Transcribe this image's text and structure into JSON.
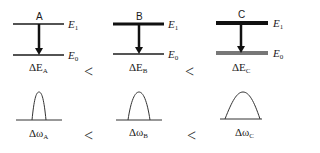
{
  "systems": [
    {
      "name": "A",
      "upper_level": "E",
      "upper_sub": "1",
      "lower_level": "E",
      "lower_sub": "0",
      "energy_delta": "ΔE",
      "energy_delta_sub": "A",
      "freq_delta": "Δω",
      "freq_delta_sub": "A",
      "upper_thickness": 1.5,
      "lower_thickness": 1.5,
      "lower_color": "#1a1a1a"
    },
    {
      "name": "B",
      "upper_level": "E",
      "upper_sub": "1",
      "lower_level": "E",
      "lower_sub": "0",
      "energy_delta": "ΔE",
      "energy_delta_sub": "B",
      "freq_delta": "Δω",
      "freq_delta_sub": "B",
      "upper_thickness": 3,
      "lower_thickness": 2,
      "lower_color": "#555555"
    },
    {
      "name": "C",
      "upper_level": "E",
      "upper_sub": "1",
      "lower_level": "E",
      "lower_sub": "0",
      "energy_delta": "ΔE",
      "energy_delta_sub": "C",
      "freq_delta": "Δω",
      "freq_delta_sub": "C",
      "upper_thickness": 4,
      "lower_thickness": 4,
      "lower_color": "#777777"
    }
  ],
  "comparison_symbol": "<"
}
